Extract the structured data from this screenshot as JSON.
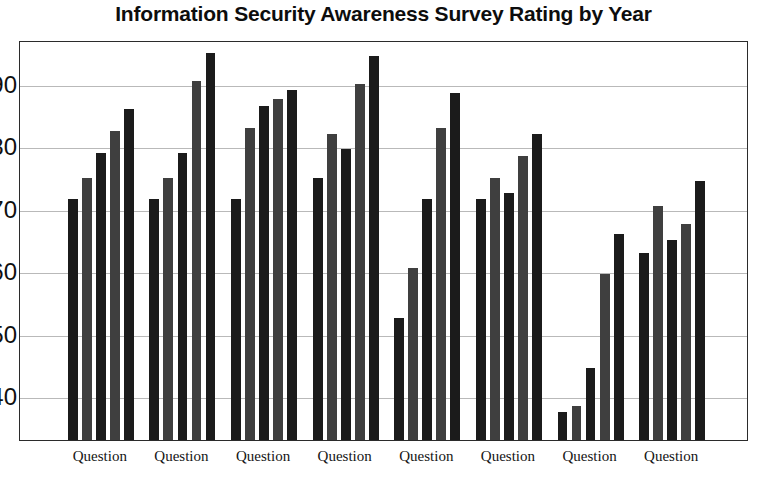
{
  "chart_data": {
    "type": "bar",
    "title": "Information Security Awareness Survey Rating by Year",
    "xlabel": "",
    "ylabel": "",
    "ylim": [
      33,
      97
    ],
    "grid": true,
    "legend": "none",
    "yticks": [
      40,
      50,
      60,
      70,
      80,
      90
    ],
    "categories": [
      "Question",
      "Question",
      "Question",
      "Question",
      "Question",
      "Question",
      "Question",
      "Question"
    ],
    "series": [
      {
        "name": "Year 1",
        "values": [
          71.5,
          71.5,
          71.5,
          75.0,
          52.5,
          71.5,
          37.5,
          63.0
        ]
      },
      {
        "name": "Year 2",
        "values": [
          75.0,
          75.0,
          83.0,
          82.0,
          60.5,
          75.0,
          38.5,
          70.5
        ]
      },
      {
        "name": "Year 3",
        "values": [
          79.0,
          79.0,
          86.5,
          79.5,
          71.5,
          72.5,
          44.5,
          65.0
        ]
      },
      {
        "name": "Year 4",
        "values": [
          82.5,
          90.5,
          87.5,
          90.0,
          83.0,
          78.5,
          59.5,
          67.5
        ]
      },
      {
        "name": "Year 5",
        "values": [
          86.0,
          95.0,
          89.0,
          94.5,
          88.5,
          82.0,
          66.0,
          74.5
        ]
      }
    ]
  },
  "colors": {
    "bar_dark": "#1b1b1b",
    "bar_light": "#3f3f3f",
    "frame": "#2b2b2b",
    "grid": "#b9b9b9",
    "text": "#101010"
  }
}
